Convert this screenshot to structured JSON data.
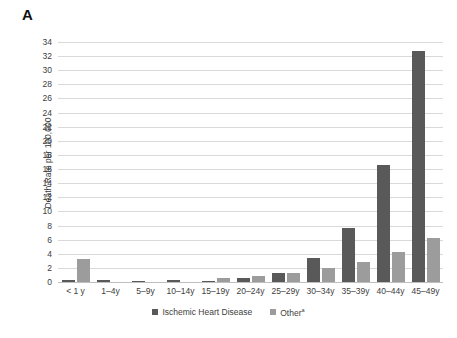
{
  "panel": {
    "label": "A"
  },
  "chart_data": {
    "type": "bar",
    "title": "",
    "xlabel": "",
    "ylabel": "Death Rate per 100,000",
    "ylim": [
      0,
      34
    ],
    "ytick_step": 2,
    "yticks": [
      0,
      2,
      4,
      6,
      8,
      10,
      12,
      14,
      16,
      18,
      20,
      22,
      24,
      26,
      28,
      30,
      32,
      34
    ],
    "grid": true,
    "legend_position": "bottom-center",
    "categories": [
      "< 1 y",
      "1–4y",
      "5–9y",
      "10–14y",
      "15–19y",
      "20–24y",
      "25–29y",
      "30–34y",
      "35–39y",
      "40–44y",
      "45–49y"
    ],
    "series": [
      {
        "name": "Ischemic Heart Disease",
        "color": "#595959",
        "values": [
          0.3,
          0.3,
          0.2,
          0.25,
          0.15,
          0.55,
          1.3,
          3.4,
          7.7,
          16.6,
          32.7
        ]
      },
      {
        "name": "Other",
        "name_superscript": "a",
        "color": "#9c9c9c",
        "values": [
          3.2,
          0.0,
          0.0,
          0.0,
          0.6,
          0.9,
          1.3,
          2.0,
          2.9,
          4.2,
          6.2
        ]
      }
    ]
  },
  "legend": {
    "items": [
      {
        "label": "Ischemic Heart Disease",
        "superscript": "",
        "color": "#595959"
      },
      {
        "label": "Other",
        "superscript": "a",
        "color": "#9c9c9c"
      }
    ]
  },
  "colors": {
    "series_primary": "#595959",
    "series_secondary": "#9c9c9c",
    "gridline": "#d9d9d9",
    "text": "#404040",
    "background": "#ffffff"
  }
}
